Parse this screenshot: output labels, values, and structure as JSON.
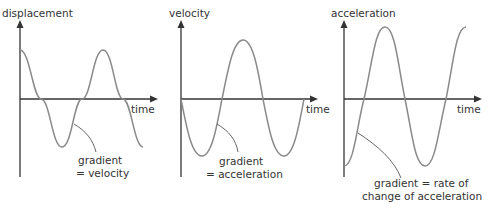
{
  "panels": [
    {
      "y_label": "displacement",
      "x_label": "time",
      "annotation_line1": "gradient",
      "annotation_line2": "= velocity"
    },
    {
      "y_label": "velocity",
      "x_label": "time",
      "annotation_line1": "gradient",
      "annotation_line2": "= acceleration"
    },
    {
      "y_label": "acceleration",
      "x_label": "time",
      "annotation_line1": "gradient = rate of",
      "annotation_line2": "change of acceleration"
    }
  ],
  "colors": {
    "axis": "#333333",
    "curve": "#8a8a8a",
    "text": "#333333",
    "background": "#ffffff"
  }
}
